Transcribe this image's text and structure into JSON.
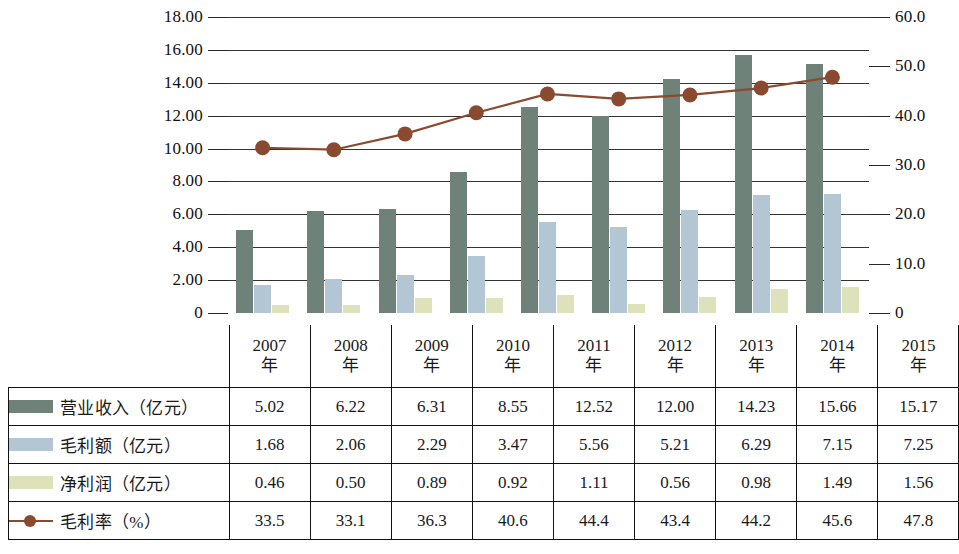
{
  "chart_data": {
    "type": "bar",
    "title": "",
    "subtitle": "",
    "xlabel": "",
    "ylabel": "",
    "categories": [
      "2007年",
      "2008年",
      "2009年",
      "2010年",
      "2011年",
      "2012年",
      "2013年",
      "2014年",
      "2015年"
    ],
    "series": [
      {
        "name": "营业收入（亿元）",
        "type": "bar",
        "axis": "left",
        "color": "#6e8279",
        "values": [
          5.02,
          6.22,
          6.31,
          8.55,
          12.52,
          12.0,
          14.23,
          15.66,
          15.17
        ]
      },
      {
        "name": "毛利额（亿元）",
        "type": "bar",
        "axis": "left",
        "color": "#b3c6d3",
        "values": [
          1.68,
          2.06,
          2.29,
          3.47,
          5.56,
          5.21,
          6.29,
          7.15,
          7.25
        ]
      },
      {
        "name": "净利润（亿元）",
        "type": "bar",
        "axis": "left",
        "color": "#dde2bb",
        "values": [
          0.46,
          0.5,
          0.89,
          0.92,
          1.11,
          0.56,
          0.98,
          1.49,
          1.56
        ]
      },
      {
        "name": "毛利率（%）",
        "type": "line",
        "axis": "right",
        "color": "#8a4a30",
        "values": [
          33.5,
          33.1,
          36.3,
          40.6,
          44.4,
          43.4,
          44.2,
          45.6,
          47.8
        ]
      }
    ],
    "left_axis": {
      "min": 0,
      "max": 18,
      "step": 2,
      "ticks": [
        "0",
        "2.00",
        "4.00",
        "6.00",
        "8.00",
        "10.00",
        "12.00",
        "14.00",
        "16.00",
        "18.00"
      ]
    },
    "right_axis": {
      "min": 0,
      "max": 60,
      "step": 10,
      "ticks": [
        "0",
        "10.0",
        "20.0",
        "30.0",
        "40.0",
        "50.0",
        "60.0"
      ]
    },
    "grid": true,
    "legend_position": "table-left-column"
  },
  "table": {
    "corner_label": "",
    "column_headers": [
      {
        "year": "2007",
        "unit": "年"
      },
      {
        "year": "2008",
        "unit": "年"
      },
      {
        "year": "2009",
        "unit": "年"
      },
      {
        "year": "2010",
        "unit": "年"
      },
      {
        "year": "2011",
        "unit": "年"
      },
      {
        "year": "2012",
        "unit": "年"
      },
      {
        "year": "2013",
        "unit": "年"
      },
      {
        "year": "2014",
        "unit": "年"
      },
      {
        "year": "2015",
        "unit": "年"
      }
    ],
    "rows": [
      {
        "label": "营业收入（亿元）",
        "swatch": "bar-swatch-revenue",
        "values": [
          "5.02",
          "6.22",
          "6.31",
          "8.55",
          "12.52",
          "12.00",
          "14.23",
          "15.66",
          "15.17"
        ]
      },
      {
        "label": "毛利额（亿元）",
        "swatch": "bar-swatch-gross-profit",
        "values": [
          "1.68",
          "2.06",
          "2.29",
          "3.47",
          "5.56",
          "5.21",
          "6.29",
          "7.15",
          "7.25"
        ]
      },
      {
        "label": "净利润（亿元）",
        "swatch": "bar-swatch-net-profit",
        "values": [
          "0.46",
          "0.50",
          "0.89",
          "0.92",
          "1.11",
          "0.56",
          "0.98",
          "1.49",
          "1.56"
        ]
      },
      {
        "label": "毛利率（%）",
        "swatch": "line-swatch-gross-margin",
        "values": [
          "33.5",
          "33.1",
          "36.3",
          "40.6",
          "44.4",
          "43.4",
          "44.2",
          "45.6",
          "47.8"
        ]
      }
    ]
  }
}
